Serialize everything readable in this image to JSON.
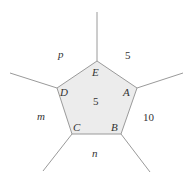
{
  "diagram": {
    "type": "pentagon-region-graph",
    "colors": {
      "stroke": "#9a9a9a",
      "fill": "#ececec",
      "text": "#333333"
    },
    "vertices": [
      {
        "id": "A",
        "label": "A"
      },
      {
        "id": "B",
        "label": "B"
      },
      {
        "id": "C",
        "label": "C"
      },
      {
        "id": "D",
        "label": "D"
      },
      {
        "id": "E",
        "label": "E"
      }
    ],
    "regions": {
      "center": "5",
      "top_right": "5",
      "right": "10",
      "bottom": "n",
      "left": "m",
      "top_left": "p"
    }
  }
}
